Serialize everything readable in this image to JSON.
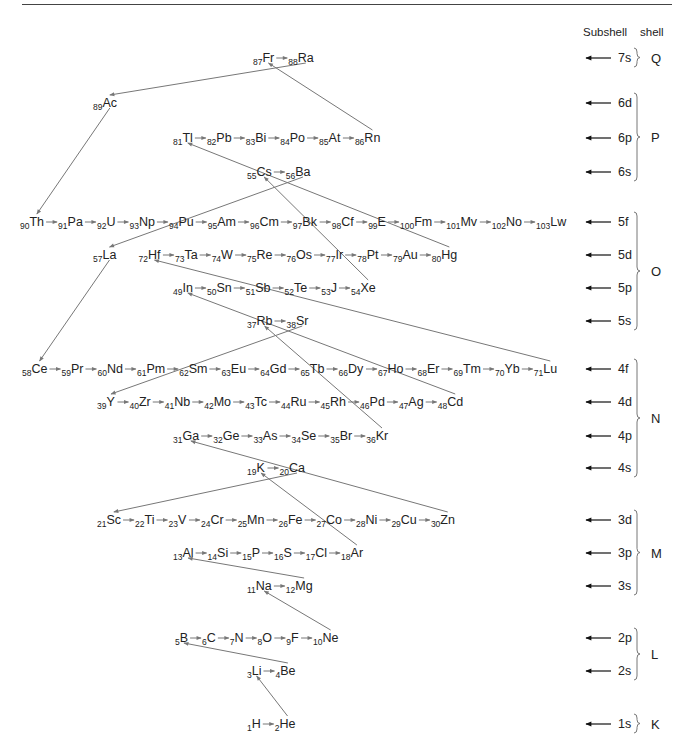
{
  "header": {
    "subshell_label": "Subshell",
    "shell_label": "shell"
  },
  "rows": [
    {
      "subshell": "7s",
      "elements": [
        [
          "87",
          "Fr"
        ],
        [
          "88",
          "Ra"
        ]
      ]
    },
    {
      "subshell": "6d",
      "elements": [
        [
          "89",
          "Ac"
        ]
      ]
    },
    {
      "subshell": "6p",
      "elements": [
        [
          "81",
          "Tl"
        ],
        [
          "82",
          "Pb"
        ],
        [
          "83",
          "Bi"
        ],
        [
          "84",
          "Po"
        ],
        [
          "85",
          "At"
        ],
        [
          "86",
          "Rn"
        ]
      ]
    },
    {
      "subshell": "6s",
      "elements": [
        [
          "55",
          "Cs"
        ],
        [
          "56",
          "Ba"
        ]
      ]
    },
    {
      "subshell": "5f",
      "elements": [
        [
          "90",
          "Th"
        ],
        [
          "91",
          "Pa"
        ],
        [
          "92",
          "U"
        ],
        [
          "93",
          "Np"
        ],
        [
          "94",
          "Pu"
        ],
        [
          "95",
          "Am"
        ],
        [
          "96",
          "Cm"
        ],
        [
          "97",
          "Bk"
        ],
        [
          "98",
          "Cf"
        ],
        [
          "99",
          "E"
        ],
        [
          "100",
          "Fm"
        ],
        [
          "101",
          "Mv"
        ],
        [
          "102",
          "No"
        ],
        [
          "103",
          "Lw"
        ]
      ]
    },
    {
      "subshell": "5d",
      "elements": [
        [
          "57",
          "La"
        ],
        [
          "72",
          "Hf"
        ],
        [
          "73",
          "Ta"
        ],
        [
          "74",
          "W"
        ],
        [
          "75",
          "Re"
        ],
        [
          "76",
          "Os"
        ],
        [
          "77",
          "Ir"
        ],
        [
          "78",
          "Pt"
        ],
        [
          "79",
          "Au"
        ],
        [
          "80",
          "Hg"
        ]
      ]
    },
    {
      "subshell": "5p",
      "elements": [
        [
          "49",
          "In"
        ],
        [
          "50",
          "Sn"
        ],
        [
          "51",
          "Sb"
        ],
        [
          "52",
          "Te"
        ],
        [
          "53",
          "J"
        ],
        [
          "54",
          "Xe"
        ]
      ]
    },
    {
      "subshell": "5s",
      "elements": [
        [
          "37",
          "Rb"
        ],
        [
          "38",
          "Sr"
        ]
      ]
    },
    {
      "subshell": "4f",
      "elements": [
        [
          "58",
          "Ce"
        ],
        [
          "59",
          "Pr"
        ],
        [
          "60",
          "Nd"
        ],
        [
          "61",
          "Pm"
        ],
        [
          "62",
          "Sm"
        ],
        [
          "63",
          "Eu"
        ],
        [
          "64",
          "Gd"
        ],
        [
          "65",
          "Tb"
        ],
        [
          "66",
          "Dy"
        ],
        [
          "67",
          "Ho"
        ],
        [
          "68",
          "Er"
        ],
        [
          "69",
          "Tm"
        ],
        [
          "70",
          "Yb"
        ],
        [
          "71",
          "Lu"
        ]
      ]
    },
    {
      "subshell": "4d",
      "elements": [
        [
          "39",
          "Y"
        ],
        [
          "40",
          "Zr"
        ],
        [
          "41",
          "Nb"
        ],
        [
          "42",
          "Mo"
        ],
        [
          "43",
          "Tc"
        ],
        [
          "44",
          "Ru"
        ],
        [
          "45",
          "Rh"
        ],
        [
          "46",
          "Pd"
        ],
        [
          "47",
          "Ag"
        ],
        [
          "48",
          "Cd"
        ]
      ]
    },
    {
      "subshell": "4p",
      "elements": [
        [
          "31",
          "Ga"
        ],
        [
          "32",
          "Ge"
        ],
        [
          "33",
          "As"
        ],
        [
          "34",
          "Se"
        ],
        [
          "35",
          "Br"
        ],
        [
          "36",
          "Kr"
        ]
      ]
    },
    {
      "subshell": "4s",
      "elements": [
        [
          "19",
          "K"
        ],
        [
          "20",
          "Ca"
        ]
      ]
    },
    {
      "subshell": "3d",
      "elements": [
        [
          "21",
          "Sc"
        ],
        [
          "22",
          "Ti"
        ],
        [
          "23",
          "V"
        ],
        [
          "24",
          "Cr"
        ],
        [
          "25",
          "Mn"
        ],
        [
          "26",
          "Fe"
        ],
        [
          "27",
          "Co"
        ],
        [
          "28",
          "Ni"
        ],
        [
          "29",
          "Cu"
        ],
        [
          "30",
          "Zn"
        ]
      ]
    },
    {
      "subshell": "3p",
      "elements": [
        [
          "13",
          "Al"
        ],
        [
          "14",
          "Si"
        ],
        [
          "15",
          "P"
        ],
        [
          "16",
          "S"
        ],
        [
          "17",
          "Cl"
        ],
        [
          "18",
          "Ar"
        ]
      ]
    },
    {
      "subshell": "3s",
      "elements": [
        [
          "11",
          "Na"
        ],
        [
          "12",
          "Mg"
        ]
      ]
    },
    {
      "subshell": "2p",
      "elements": [
        [
          "5",
          "B"
        ],
        [
          "6",
          "C"
        ],
        [
          "7",
          "N"
        ],
        [
          "8",
          "O"
        ],
        [
          "9",
          "F"
        ],
        [
          "10",
          "Ne"
        ]
      ]
    },
    {
      "subshell": "2s",
      "elements": [
        [
          "3",
          "Li"
        ],
        [
          "4",
          "Be"
        ]
      ]
    },
    {
      "subshell": "1s",
      "elements": [
        [
          "1",
          "H"
        ],
        [
          "2",
          "He"
        ]
      ]
    }
  ],
  "shells": [
    {
      "name": "Q",
      "subshells": [
        "7s"
      ]
    },
    {
      "name": "P",
      "subshells": [
        "6d",
        "6p",
        "6s"
      ]
    },
    {
      "name": "O",
      "subshells": [
        "5f",
        "5d",
        "5p",
        "5s"
      ]
    },
    {
      "name": "N",
      "subshells": [
        "4f",
        "4d",
        "4p",
        "4s"
      ]
    },
    {
      "name": "M",
      "subshells": [
        "3d",
        "3p",
        "3s"
      ]
    },
    {
      "name": "L",
      "subshells": [
        "2p",
        "2s"
      ]
    },
    {
      "name": "K",
      "subshells": [
        "1s"
      ]
    }
  ],
  "filling_links": [
    [
      "He",
      "Li"
    ],
    [
      "Be",
      "B"
    ],
    [
      "Ne",
      "Na"
    ],
    [
      "Mg",
      "Al"
    ],
    [
      "Ar",
      "K"
    ],
    [
      "Ca",
      "Sc"
    ],
    [
      "Zn",
      "Ga"
    ],
    [
      "Kr",
      "Rb"
    ],
    [
      "Sr",
      "Y"
    ],
    [
      "Cd",
      "In"
    ],
    [
      "Xe",
      "Cs"
    ],
    [
      "Ba",
      "La"
    ],
    [
      "La",
      "Ce"
    ],
    [
      "Lu",
      "Hf"
    ],
    [
      "Hg",
      "Tl"
    ],
    [
      "Rn",
      "Fr"
    ],
    [
      "Ra",
      "Ac"
    ],
    [
      "Ac",
      "Th"
    ]
  ]
}
